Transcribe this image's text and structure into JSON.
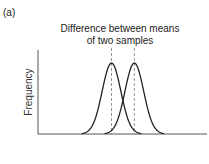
{
  "panel_label": "(a)",
  "chart_data": {
    "type": "line",
    "title_lines": [
      "Difference between means",
      "of two samples"
    ],
    "xlabel": "",
    "ylabel": "Frequency",
    "grid": false,
    "legend": "none",
    "xlim": [
      0,
      10
    ],
    "ylim": [
      0,
      1
    ],
    "series": [
      {
        "name": "sample-1",
        "mean": 4.35,
        "sd": 0.55,
        "peak": 1.0
      },
      {
        "name": "sample-2",
        "mean": 5.7,
        "sd": 0.55,
        "peak": 1.0
      }
    ],
    "mean_markers": [
      4.35,
      5.7
    ]
  }
}
